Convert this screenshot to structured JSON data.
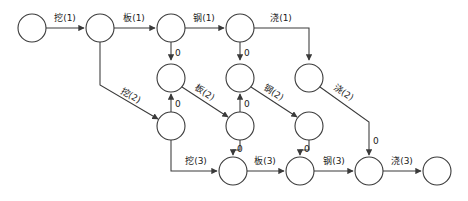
{
  "diagram": {
    "type": "activity-network",
    "colors": {
      "stroke": "#3a3a3a",
      "node_fill": "#ffffff",
      "text": "#1a1a1a",
      "background": "#ffffff"
    },
    "node_radius": 14,
    "nodes": [
      {
        "id": "n1",
        "cx": 32,
        "cy": 28,
        "r": 14
      },
      {
        "id": "n2",
        "cx": 100,
        "cy": 28,
        "r": 14
      },
      {
        "id": "n3",
        "cx": 171,
        "cy": 28,
        "r": 14
      },
      {
        "id": "n4",
        "cx": 240,
        "cy": 28,
        "r": 14
      },
      {
        "id": "n5",
        "cx": 171,
        "cy": 78,
        "r": 14
      },
      {
        "id": "n6",
        "cx": 240,
        "cy": 78,
        "r": 14
      },
      {
        "id": "n7",
        "cx": 309,
        "cy": 78,
        "r": 14
      },
      {
        "id": "n8",
        "cx": 171,
        "cy": 126,
        "r": 14
      },
      {
        "id": "n9",
        "cx": 240,
        "cy": 126,
        "r": 14
      },
      {
        "id": "n10",
        "cx": 309,
        "cy": 126,
        "r": 14
      },
      {
        "id": "n11",
        "cx": 233,
        "cy": 171,
        "r": 14
      },
      {
        "id": "n12",
        "cx": 300,
        "cy": 171,
        "r": 14
      },
      {
        "id": "n13",
        "cx": 369,
        "cy": 171,
        "r": 14
      },
      {
        "id": "n14",
        "cx": 437,
        "cy": 171,
        "r": 14
      }
    ],
    "edges": [
      {
        "id": "e1",
        "label": "挖(1)",
        "from": "n1",
        "to": "n2",
        "kind": "activity"
      },
      {
        "id": "e2",
        "label": "板(1)",
        "from": "n2",
        "to": "n3",
        "kind": "activity"
      },
      {
        "id": "e3",
        "label": "钢(1)",
        "from": "n3",
        "to": "n4",
        "kind": "activity"
      },
      {
        "id": "e4",
        "label": "浇(1)",
        "from": "n4",
        "to": "n7",
        "kind": "activity"
      },
      {
        "id": "e5",
        "label": "挖(2)",
        "from": "n2",
        "to": "n8",
        "kind": "activity"
      },
      {
        "id": "e6",
        "label": "板(2)",
        "from": "n5",
        "to": "n9",
        "kind": "activity"
      },
      {
        "id": "e7",
        "label": "钢(2)",
        "from": "n6",
        "to": "n10",
        "kind": "activity"
      },
      {
        "id": "e8",
        "label": "浇(2)",
        "from": "n7",
        "to": "n13",
        "kind": "activity"
      },
      {
        "id": "e9",
        "label": "挖(3)",
        "from": "n8",
        "to": "n11",
        "kind": "activity"
      },
      {
        "id": "e10",
        "label": "板(3)",
        "from": "n11",
        "to": "n12",
        "kind": "activity"
      },
      {
        "id": "e11",
        "label": "钢(3)",
        "from": "n12",
        "to": "n13",
        "kind": "activity"
      },
      {
        "id": "e12",
        "label": "浇(3)",
        "from": "n13",
        "to": "n14",
        "kind": "activity"
      },
      {
        "id": "d1",
        "label": "0",
        "from": "n3",
        "to": "n5",
        "kind": "dummy"
      },
      {
        "id": "d2",
        "label": "0",
        "from": "n4",
        "to": "n6",
        "kind": "dummy"
      },
      {
        "id": "d3",
        "label": "0",
        "from": "n8",
        "to": "n5",
        "kind": "dummy"
      },
      {
        "id": "d4",
        "label": "0",
        "from": "n9",
        "to": "n6",
        "kind": "dummy"
      },
      {
        "id": "d5",
        "label": "0",
        "from": "n9",
        "to": "n11",
        "kind": "dummy"
      },
      {
        "id": "d6",
        "label": "0",
        "from": "n10",
        "to": "n12",
        "kind": "dummy"
      },
      {
        "id": "d7",
        "label": "0",
        "from": "n7",
        "to": "n13",
        "kind": "dummy"
      }
    ],
    "labels": {
      "dig1": "挖(1)",
      "dig2": "挖(2)",
      "dig3": "挖(3)",
      "form1": "板(1)",
      "form2": "板(2)",
      "form3": "板(3)",
      "steel1": "钢(1)",
      "steel2": "钢(2)",
      "steel3": "钢(3)",
      "pour1": "浇(1)",
      "pour2": "浇(2)",
      "pour3": "浇(3)",
      "zero": "0"
    }
  }
}
